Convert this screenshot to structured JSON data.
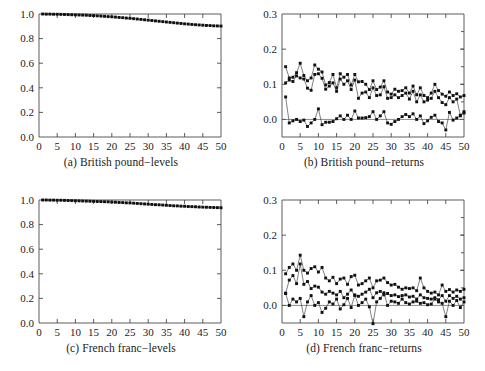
{
  "figure": {
    "layout": "2x2 grid of panels",
    "panel_order": [
      "a",
      "b",
      "c",
      "d"
    ]
  },
  "chart_data": [
    {
      "id": "a",
      "type": "line",
      "title": "(a) British pound−levels",
      "xlabel": "",
      "ylabel": "",
      "xlim": [
        0,
        50
      ],
      "ylim": [
        0.0,
        1.0
      ],
      "xticks": [
        0,
        5,
        10,
        15,
        20,
        25,
        30,
        35,
        40,
        45,
        50
      ],
      "xticklabels": [
        "0",
        "5",
        "10",
        "15",
        "20",
        "25",
        "30",
        "35",
        "40",
        "45",
        "50"
      ],
      "yticks": [
        0.0,
        0.2,
        0.4,
        0.6,
        0.8,
        1.0
      ],
      "yticklabels": [
        "0.0",
        "0.2",
        "0.4",
        "0.6",
        "0.8",
        "1.0"
      ],
      "grid": false,
      "legend": "none",
      "marker": "square",
      "x": [
        1,
        2,
        3,
        4,
        5,
        6,
        7,
        8,
        9,
        10,
        11,
        12,
        13,
        14,
        15,
        16,
        17,
        18,
        19,
        20,
        21,
        22,
        23,
        24,
        25,
        26,
        27,
        28,
        29,
        30,
        31,
        32,
        33,
        34,
        35,
        36,
        37,
        38,
        39,
        40,
        41,
        42,
        43,
        44,
        45,
        46,
        47,
        48,
        49,
        50
      ],
      "series": [
        {
          "name": "level",
          "values": [
            1.0,
            0.999,
            0.999,
            0.998,
            0.998,
            0.997,
            0.996,
            0.995,
            0.994,
            0.993,
            0.992,
            0.991,
            0.99,
            0.988,
            0.987,
            0.985,
            0.983,
            0.981,
            0.979,
            0.977,
            0.975,
            0.972,
            0.97,
            0.967,
            0.965,
            0.962,
            0.959,
            0.956,
            0.953,
            0.95,
            0.947,
            0.944,
            0.941,
            0.938,
            0.935,
            0.932,
            0.929,
            0.926,
            0.923,
            0.92,
            0.918,
            0.915,
            0.913,
            0.911,
            0.909,
            0.907,
            0.906,
            0.904,
            0.903,
            0.902
          ]
        }
      ]
    },
    {
      "id": "b",
      "type": "line",
      "title": "(b) British pound−returns",
      "xlabel": "",
      "ylabel": "",
      "xlim": [
        0,
        50
      ],
      "ylim": [
        -0.05,
        0.3
      ],
      "xticks": [
        0,
        5,
        10,
        15,
        20,
        25,
        30,
        35,
        40,
        45,
        50
      ],
      "xticklabels": [
        "0",
        "5",
        "10",
        "15",
        "20",
        "25",
        "30",
        "35",
        "40",
        "45",
        "50"
      ],
      "yticks": [
        0.0,
        0.1,
        0.2,
        0.3
      ],
      "yticklabels": [
        "0.0",
        "0.1",
        "0.2",
        "0.3"
      ],
      "grid": false,
      "legend": "none",
      "marker": "square",
      "zero_reference_line": 0.0,
      "x": [
        1,
        2,
        3,
        4,
        5,
        6,
        7,
        8,
        9,
        10,
        11,
        12,
        13,
        14,
        15,
        16,
        17,
        18,
        19,
        20,
        21,
        22,
        23,
        24,
        25,
        26,
        27,
        28,
        29,
        30,
        31,
        32,
        33,
        34,
        35,
        36,
        37,
        38,
        39,
        40,
        41,
        42,
        43,
        44,
        45,
        46,
        47,
        48,
        49,
        50
      ],
      "series": [
        {
          "name": "upper-band",
          "values": [
            0.15,
            0.118,
            0.12,
            0.133,
            0.16,
            0.125,
            0.11,
            0.118,
            0.155,
            0.143,
            0.135,
            0.098,
            0.105,
            0.128,
            0.09,
            0.13,
            0.12,
            0.128,
            0.098,
            0.128,
            0.107,
            0.108,
            0.1,
            0.085,
            0.11,
            0.085,
            0.092,
            0.11,
            0.078,
            0.072,
            0.086,
            0.08,
            0.082,
            0.09,
            0.075,
            0.095,
            0.07,
            0.09,
            0.068,
            0.062,
            0.075,
            0.1,
            0.082,
            0.072,
            0.066,
            0.078,
            0.068,
            0.073,
            0.064,
            0.068
          ]
        },
        {
          "name": "lower-band",
          "values": [
            0.104,
            0.112,
            0.108,
            0.124,
            0.118,
            0.115,
            0.089,
            0.083,
            0.128,
            0.13,
            0.117,
            0.086,
            0.095,
            0.104,
            0.08,
            0.115,
            0.1,
            0.11,
            0.085,
            0.112,
            0.06,
            0.075,
            0.078,
            0.062,
            0.09,
            0.068,
            0.07,
            0.093,
            0.06,
            0.062,
            0.07,
            0.062,
            0.068,
            0.075,
            0.058,
            0.08,
            0.05,
            0.07,
            0.05,
            0.055,
            0.06,
            0.08,
            0.062,
            0.048,
            0.042,
            0.062,
            0.05,
            0.058,
            0.012,
            0.022
          ]
        },
        {
          "name": "returns",
          "values": [
            0.064,
            -0.01,
            -0.004,
            0.0,
            -0.006,
            -0.002,
            -0.02,
            -0.01,
            0.0,
            0.03,
            -0.015,
            -0.008,
            -0.008,
            -0.006,
            0.002,
            0.01,
            0.0,
            0.012,
            0.0,
            0.024,
            0.004,
            0.004,
            0.005,
            0.008,
            0.022,
            0.0,
            0.01,
            0.022,
            -0.01,
            -0.014,
            -0.006,
            0.0,
            0.008,
            0.014,
            0.008,
            0.016,
            0.0,
            0.01,
            -0.012,
            -0.004,
            0.006,
            0.012,
            -0.006,
            -0.01,
            -0.03,
            0.02,
            -0.002,
            0.004,
            0.01,
            0.018
          ]
        }
      ]
    },
    {
      "id": "c",
      "type": "line",
      "title": "(c) French franc−levels",
      "xlabel": "",
      "ylabel": "",
      "xlim": [
        0,
        50
      ],
      "ylim": [
        0.0,
        1.0
      ],
      "xticks": [
        0,
        5,
        10,
        15,
        20,
        25,
        30,
        35,
        40,
        45,
        50
      ],
      "xticklabels": [
        "0",
        "5",
        "10",
        "15",
        "20",
        "25",
        "30",
        "35",
        "40",
        "45",
        "50"
      ],
      "yticks": [
        0.0,
        0.2,
        0.4,
        0.6,
        0.8,
        1.0
      ],
      "yticklabels": [
        "0.0",
        "0.2",
        "0.4",
        "0.6",
        "0.8",
        "1.0"
      ],
      "grid": false,
      "legend": "none",
      "marker": "square",
      "x": [
        1,
        2,
        3,
        4,
        5,
        6,
        7,
        8,
        9,
        10,
        11,
        12,
        13,
        14,
        15,
        16,
        17,
        18,
        19,
        20,
        21,
        22,
        23,
        24,
        25,
        26,
        27,
        28,
        29,
        30,
        31,
        32,
        33,
        34,
        35,
        36,
        37,
        38,
        39,
        40,
        41,
        42,
        43,
        44,
        45,
        46,
        47,
        48,
        49,
        50
      ],
      "series": [
        {
          "name": "level",
          "values": [
            1.0,
            1.0,
            0.999,
            0.999,
            0.998,
            0.998,
            0.997,
            0.996,
            0.995,
            0.994,
            0.993,
            0.992,
            0.991,
            0.99,
            0.989,
            0.988,
            0.987,
            0.986,
            0.985,
            0.983,
            0.982,
            0.98,
            0.979,
            0.977,
            0.976,
            0.974,
            0.972,
            0.97,
            0.968,
            0.966,
            0.964,
            0.962,
            0.961,
            0.959,
            0.957,
            0.955,
            0.953,
            0.952,
            0.95,
            0.949,
            0.947,
            0.946,
            0.945,
            0.943,
            0.942,
            0.941,
            0.94,
            0.939,
            0.938,
            0.937
          ]
        }
      ]
    },
    {
      "id": "d",
      "type": "line",
      "title": "(d) French franc−returns",
      "xlabel": "",
      "ylabel": "",
      "xlim": [
        0,
        50
      ],
      "ylim": [
        -0.05,
        0.3
      ],
      "xticks": [
        0,
        5,
        10,
        15,
        20,
        25,
        30,
        35,
        40,
        45,
        50
      ],
      "xticklabels": [
        "0",
        "5",
        "10",
        "15",
        "20",
        "25",
        "30",
        "35",
        "40",
        "45",
        "50"
      ],
      "yticks": [
        0.0,
        0.1,
        0.2,
        0.3
      ],
      "yticklabels": [
        "0.0",
        "0.1",
        "0.2",
        "0.3"
      ],
      "grid": false,
      "legend": "none",
      "marker": "square",
      "zero_reference_line": 0.0,
      "x": [
        1,
        2,
        3,
        4,
        5,
        6,
        7,
        8,
        9,
        10,
        11,
        12,
        13,
        14,
        15,
        16,
        17,
        18,
        19,
        20,
        21,
        22,
        23,
        24,
        25,
        26,
        27,
        28,
        29,
        30,
        31,
        32,
        33,
        34,
        35,
        36,
        37,
        38,
        39,
        40,
        41,
        42,
        43,
        44,
        45,
        46,
        47,
        48,
        49,
        50
      ],
      "series": [
        {
          "name": "upper-band",
          "values": [
            0.09,
            0.108,
            0.118,
            0.1,
            0.143,
            0.1,
            0.092,
            0.105,
            0.11,
            0.095,
            0.108,
            0.078,
            0.07,
            0.08,
            0.062,
            0.075,
            0.078,
            0.06,
            0.082,
            0.086,
            0.058,
            0.062,
            0.07,
            0.078,
            0.05,
            0.07,
            0.072,
            0.078,
            0.065,
            0.058,
            0.06,
            0.052,
            0.046,
            0.05,
            0.048,
            0.05,
            0.042,
            0.078,
            0.05,
            0.04,
            0.035,
            0.038,
            0.03,
            0.058,
            0.04,
            0.045,
            0.038,
            0.044,
            0.04,
            0.046
          ]
        },
        {
          "name": "lower-band",
          "values": [
            0.035,
            0.072,
            0.085,
            0.062,
            0.118,
            0.06,
            0.068,
            0.048,
            0.055,
            0.052,
            0.038,
            0.032,
            0.04,
            0.035,
            0.03,
            0.04,
            0.022,
            0.032,
            0.044,
            0.028,
            0.026,
            0.032,
            0.038,
            0.046,
            0.022,
            0.036,
            0.04,
            0.03,
            0.034,
            0.028,
            0.03,
            0.025,
            0.028,
            0.03,
            0.024,
            0.026,
            0.018,
            0.03,
            0.022,
            0.02,
            0.018,
            0.022,
            0.016,
            0.028,
            0.012,
            0.028,
            0.02,
            0.026,
            0.018,
            0.022
          ]
        },
        {
          "name": "returns",
          "values": [
            0.034,
            0.0,
            0.018,
            0.01,
            0.02,
            -0.032,
            0.01,
            0.028,
            0.0,
            0.008,
            -0.02,
            -0.008,
            0.01,
            0.004,
            0.018,
            -0.01,
            0.002,
            0.02,
            -0.006,
            0.03,
            0.0,
            0.008,
            0.018,
            -0.004,
            -0.052,
            0.01,
            0.02,
            0.036,
            0.0,
            0.012,
            0.01,
            0.006,
            0.018,
            0.008,
            0.004,
            0.01,
            0.012,
            0.006,
            0.008,
            0.002,
            0.004,
            0.018,
            0.01,
            0.006,
            -0.032,
            0.012,
            0.0,
            0.014,
            -0.006,
            0.01
          ]
        }
      ]
    }
  ]
}
